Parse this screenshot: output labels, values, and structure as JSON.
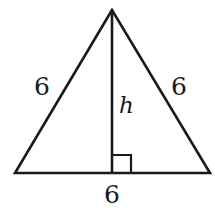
{
  "diagram": {
    "type": "triangle",
    "stroke_color": "#1a1a1a",
    "background": "#ffffff",
    "vertices": {
      "apex": [
        112,
        10
      ],
      "bottom_left": [
        15,
        173
      ],
      "bottom_right": [
        210,
        173
      ]
    },
    "altitude": {
      "from": [
        112,
        10
      ],
      "to": [
        112,
        173
      ],
      "label": "h"
    },
    "right_angle_marker": {
      "x": 112,
      "y": 155,
      "size": 18
    },
    "labels": {
      "left_side": "6",
      "right_side": "6",
      "base": "6",
      "height": "h"
    }
  }
}
